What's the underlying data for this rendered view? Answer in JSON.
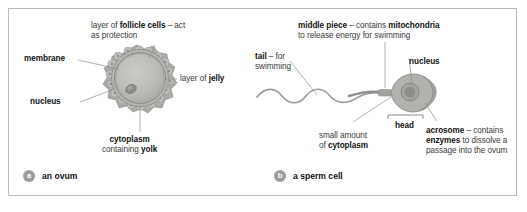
{
  "figure": {
    "panels": [
      {
        "badge": "a",
        "caption": "an ovum",
        "labels": {
          "follicle": {
            "line1_pre": "layer of ",
            "line1_kw": "follicle cells",
            "line1_post": " – act",
            "line2": "as protection"
          },
          "membrane": "membrane",
          "nucleus": "nucleus",
          "jelly_pre": "layer of ",
          "jelly_kw": "jelly",
          "cytoplasm_kw": "cytoplasm",
          "cytoplasm_line2_pre": "containing ",
          "cytoplasm_line2_kw": "yolk"
        }
      },
      {
        "badge": "b",
        "caption": "a sperm cell",
        "labels": {
          "middle_kw": "middle piece",
          "middle_post": " – contains ",
          "middle_kw2": "mitochondria",
          "middle_line2": "to release energy for swimming",
          "tail_kw": "tail",
          "tail_post": " – for",
          "tail_line2": "swimming",
          "nucleus": "nucleus",
          "head": "head",
          "cytoplasm_line1": "small amount",
          "cytoplasm_line2_pre": "of ",
          "cytoplasm_line2_kw": "cytoplasm",
          "acrosome_kw": "acrosome",
          "acrosome_post": " – contains",
          "acrosome_kw2": "enzymes",
          "acrosome_line2_post": " to dissolve a",
          "acrosome_line3": "passage into the ovum"
        }
      }
    ],
    "colors": {
      "frame_border": "#b9bcbe",
      "leader_line": "#8d8f91",
      "badge_fill": "#9a9c9e",
      "text": "#231f20",
      "cell_fill": "#b7b8b4",
      "cell_inner": "#c3c4c0",
      "follicle_fill": "#adafab"
    }
  }
}
